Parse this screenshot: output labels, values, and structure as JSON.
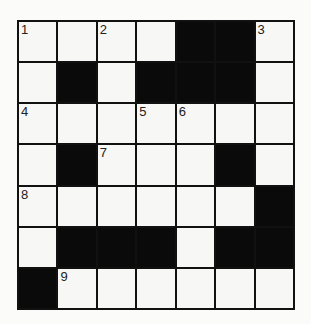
{
  "puzzle": {
    "rows": 7,
    "cols": 7,
    "grid": [
      [
        "",
        "",
        "",
        "",
        "#",
        "#",
        ""
      ],
      [
        "",
        "#",
        "",
        "#",
        "#",
        "#",
        ""
      ],
      [
        "",
        "",
        "",
        "",
        "",
        "",
        ""
      ],
      [
        "",
        "#",
        "",
        "",
        "",
        "#",
        ""
      ],
      [
        "",
        "",
        "",
        "",
        "",
        "",
        "#"
      ],
      [
        "",
        "#",
        "#",
        "#",
        "",
        "#",
        "#"
      ],
      [
        "#",
        "",
        "",
        "",
        "",
        "",
        ""
      ]
    ],
    "numbers": [
      {
        "row": 0,
        "col": 0,
        "n": "1"
      },
      {
        "row": 0,
        "col": 2,
        "n": "2"
      },
      {
        "row": 0,
        "col": 6,
        "n": "3"
      },
      {
        "row": 2,
        "col": 0,
        "n": "4"
      },
      {
        "row": 2,
        "col": 3,
        "n": "5"
      },
      {
        "row": 2,
        "col": 4,
        "n": "6"
      },
      {
        "row": 3,
        "col": 2,
        "n": "7"
      },
      {
        "row": 4,
        "col": 0,
        "n": "8"
      },
      {
        "row": 6,
        "col": 1,
        "n": "9"
      }
    ]
  }
}
